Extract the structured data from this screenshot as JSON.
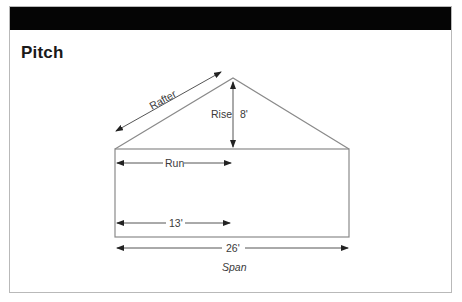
{
  "title": "Pitch",
  "diagram": {
    "labels": {
      "rafter": "Rafter",
      "rise": "Rise",
      "rise_value": "8'",
      "run": "Run",
      "run_value": "13'",
      "span_value": "26'",
      "span": "Span"
    },
    "colors": {
      "header": "#050505",
      "lines": "#8a8a8a",
      "arrows": "#222222",
      "text": "#3a3a3a"
    }
  }
}
